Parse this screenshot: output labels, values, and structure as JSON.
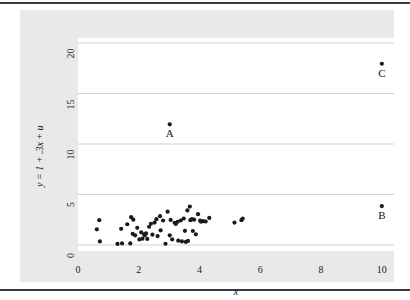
{
  "chart_data": {
    "type": "scatter",
    "title": "",
    "xlabel": "x",
    "ylabel": "y = 1 + .3x + u",
    "xlim": [
      0,
      10.4
    ],
    "ylim": [
      -0.6,
      20.5
    ],
    "xticks": [
      0,
      2,
      4,
      6,
      8,
      10
    ],
    "xtick_labels": [
      "0",
      "2",
      "4",
      "6",
      "8",
      "10"
    ],
    "yticks": [
      0,
      5,
      10,
      15,
      20
    ],
    "ytick_labels": [
      "0",
      "5",
      "10",
      "15",
      "20"
    ],
    "grid": "horizontal",
    "legend": "none",
    "marker_color": "#1a1a1a",
    "gridline_color": "#c8c8c8",
    "plot_background": "#ffffff",
    "graph_background": "#e9e9e9",
    "series": [
      {
        "name": "main cloud",
        "points": [
          [
            0.62,
            1.55
          ],
          [
            0.7,
            2.45
          ],
          [
            0.72,
            0.35
          ],
          [
            1.3,
            0.1
          ],
          [
            1.42,
            1.6
          ],
          [
            1.45,
            0.15
          ],
          [
            1.62,
            2.05
          ],
          [
            1.72,
            0.15
          ],
          [
            1.75,
            2.75
          ],
          [
            1.8,
            1.1
          ],
          [
            1.82,
            2.5
          ],
          [
            1.88,
            0.95
          ],
          [
            1.95,
            1.7
          ],
          [
            2.02,
            0.55
          ],
          [
            2.08,
            1.25
          ],
          [
            2.12,
            0.62
          ],
          [
            2.18,
            1.05
          ],
          [
            2.2,
            0.95
          ],
          [
            2.24,
            1.15
          ],
          [
            2.28,
            0.6
          ],
          [
            2.34,
            1.8
          ],
          [
            2.4,
            2.1
          ],
          [
            2.45,
            1.02
          ],
          [
            2.52,
            2.22
          ],
          [
            2.58,
            2.55
          ],
          [
            2.62,
            0.88
          ],
          [
            2.7,
            2.85
          ],
          [
            2.72,
            1.45
          ],
          [
            2.8,
            2.42
          ],
          [
            2.88,
            0.12
          ],
          [
            2.95,
            3.3
          ],
          [
            3.02,
            0.95
          ],
          [
            3.05,
            2.48
          ],
          [
            3.1,
            0.55
          ],
          [
            3.18,
            2.2
          ],
          [
            3.22,
            2.08
          ],
          [
            3.28,
            2.3
          ],
          [
            3.3,
            0.42
          ],
          [
            3.38,
            2.42
          ],
          [
            3.42,
            0.35
          ],
          [
            3.48,
            2.62
          ],
          [
            3.52,
            1.4
          ],
          [
            3.55,
            0.3
          ],
          [
            3.6,
            3.42
          ],
          [
            3.62,
            0.4
          ],
          [
            3.68,
            3.8
          ],
          [
            3.7,
            2.45
          ],
          [
            3.75,
            2.55
          ],
          [
            3.78,
            1.38
          ],
          [
            3.82,
            2.5
          ],
          [
            3.88,
            1.05
          ],
          [
            3.95,
            3.05
          ],
          [
            4.02,
            2.4
          ],
          [
            4.05,
            2.3
          ],
          [
            4.12,
            2.35
          ],
          [
            4.2,
            2.32
          ],
          [
            4.32,
            2.68
          ],
          [
            5.15,
            2.22
          ],
          [
            5.38,
            2.45
          ],
          [
            5.42,
            2.62
          ]
        ]
      },
      {
        "name": "labeled outliers",
        "points": [
          [
            3.02,
            11.95
          ],
          [
            10.0,
            3.85
          ],
          [
            10.0,
            17.95
          ]
        ],
        "labels": [
          "A",
          "B",
          "C"
        ]
      }
    ],
    "annotations": [
      {
        "text": "A",
        "x": 3.02,
        "y": 11.95,
        "position": "below"
      },
      {
        "text": "B",
        "x": 10.0,
        "y": 3.85,
        "position": "below"
      },
      {
        "text": "C",
        "x": 10.0,
        "y": 17.95,
        "position": "below"
      }
    ]
  }
}
